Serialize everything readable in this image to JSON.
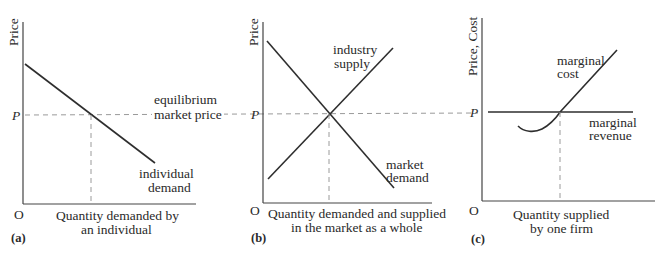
{
  "figure": {
    "shared": {
      "price_level_label": "P",
      "origin_label": "O",
      "equilibrium_label_line1": "equilibrium",
      "equilibrium_label_line2": "market price"
    },
    "panels": [
      {
        "id": "a",
        "tag": "(a)",
        "y_axis_label": "Price",
        "x_axis_label_line1": "Quantity demanded by",
        "x_axis_label_line2": "an individual",
        "curves": [
          {
            "name": "individual demand",
            "label_line1": "individual",
            "label_line2": "demand"
          }
        ]
      },
      {
        "id": "b",
        "tag": "(b)",
        "y_axis_label": "Price",
        "x_axis_label_line1": "Quantity demanded and supplied",
        "x_axis_label_line2": "in the market as a whole",
        "curves": [
          {
            "name": "industry supply",
            "label_line1": "industry",
            "label_line2": "supply"
          },
          {
            "name": "market demand",
            "label_line1": "market",
            "label_line2": "demand"
          }
        ]
      },
      {
        "id": "c",
        "tag": "(c)",
        "y_axis_label": "Price, Cost",
        "x_axis_label_line1": "Quantity supplied",
        "x_axis_label_line2": "by one firm",
        "curves": [
          {
            "name": "marginal cost",
            "label_line1": "marginal",
            "label_line2": "cost"
          },
          {
            "name": "marginal revenue",
            "label_line1": "marginal",
            "label_line2": "revenue"
          }
        ]
      }
    ]
  },
  "colors": {
    "curve": "#2e2e2e",
    "axis": "#444444",
    "dashed_guide": "#9a9a9a",
    "text": "#2a2a2a",
    "background": "#ffffff"
  }
}
